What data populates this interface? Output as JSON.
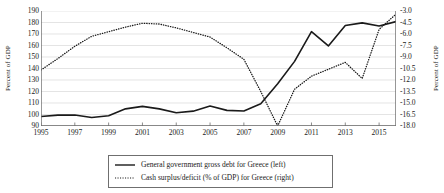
{
  "chart_data": {
    "type": "line",
    "title": "",
    "xlabel": "",
    "ylabel": "Percent of GDP",
    "ylabel_right": "Percent of GDP",
    "grid": true,
    "legend_position": "bottom",
    "x": [
      1995,
      1996,
      1997,
      1998,
      1999,
      2000,
      2001,
      2002,
      2003,
      2004,
      2005,
      2006,
      2007,
      2008,
      2009,
      2010,
      2011,
      2012,
      2013,
      2014,
      2015,
      2016
    ],
    "xticks": [
      1995,
      1997,
      1999,
      2001,
      2003,
      2005,
      2007,
      2009,
      2011,
      2013,
      2015
    ],
    "ylim": [
      90,
      190
    ],
    "yticks": [
      90,
      100,
      110,
      120,
      130,
      140,
      150,
      160,
      170,
      180,
      190
    ],
    "ylim_right": [
      -18.0,
      -3.0
    ],
    "yticks_right": [
      "-3.0",
      "-4.5",
      "-6.0",
      "-7.5",
      "-9.0",
      "-10.5",
      "-12.0",
      "-13.5",
      "-15.0",
      "-16.5",
      "-18.0"
    ],
    "series": [
      {
        "name": "General government gross debt for Greece (left)",
        "axis": "left",
        "style": "solid",
        "color": "#1a1a1a",
        "values": [
          98.3,
          99.5,
          99.6,
          97.4,
          98.9,
          104.9,
          107.1,
          104.9,
          101.5,
          102.9,
          107.4,
          103.6,
          103.1,
          109.4,
          126.7,
          146.2,
          172.1,
          159.6,
          177.4,
          179.7,
          176.9,
          180.8
        ]
      },
      {
        "name": "Cash surplus/deficit (% of GDP) for Greece (right)",
        "axis": "right",
        "style": "dotted",
        "color": "#1a1a1a",
        "values": [
          -10.7,
          -9.2,
          -7.6,
          -6.3,
          -5.7,
          -5.1,
          -4.6,
          -4.7,
          -5.2,
          -5.8,
          -6.4,
          -7.8,
          -9.3,
          -13.5,
          -18.0,
          -13.2,
          -11.5,
          -10.6,
          -9.7,
          -11.8,
          -5.4,
          -3.4
        ]
      }
    ]
  },
  "axis_left": {
    "title": "Percent of GDP",
    "labels": [
      "190",
      "180",
      "170",
      "160",
      "150",
      "140",
      "130",
      "120",
      "110",
      "100",
      "90"
    ]
  },
  "axis_right": {
    "title": "Percent of GDP",
    "labels": [
      "-3.0",
      "-4.5",
      "-6.0",
      "-7.5",
      "-9.0",
      "-10.5",
      "-12.0",
      "-13.5",
      "-15.0",
      "-16.5",
      "-18.0"
    ]
  },
  "axis_x": {
    "labels": [
      "1995",
      "1997",
      "1999",
      "2001",
      "2003",
      "2005",
      "2007",
      "2009",
      "2011",
      "2013",
      "2015"
    ]
  },
  "legend": {
    "items": [
      {
        "label": "General government gross debt for Greece (left)",
        "style": "solid"
      },
      {
        "label": "Cash surplus/deficit (% of GDP) for Greece (right)",
        "style": "dotted"
      }
    ]
  },
  "colors": {
    "line": "#1a1a1a",
    "grid": "#d9d9d9",
    "axis": "#6f6f6f",
    "background": "#ffffff"
  }
}
